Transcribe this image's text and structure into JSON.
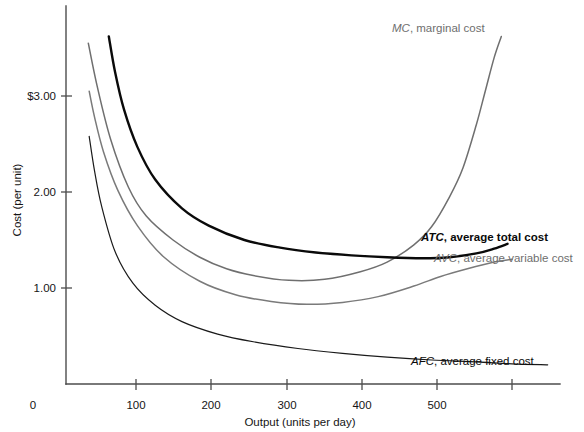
{
  "chart_data": {
    "type": "line",
    "title": "",
    "xlabel": "Output (units per day)",
    "ylabel": "Cost (per unit)",
    "xlim": [
      0,
      560
    ],
    "ylim": [
      0,
      3.5
    ],
    "xticks": [
      0,
      100,
      200,
      300,
      400,
      500
    ],
    "xtick_labels": [
      "0",
      "100",
      "200",
      "300",
      "400",
      "500"
    ],
    "yticks": [
      1.0,
      2.0,
      3.0
    ],
    "ytick_labels": [
      "1.00",
      "2.00",
      "$3.00"
    ],
    "grid": false,
    "legend_position": "inline-annotations",
    "series": [
      {
        "name": "MC",
        "label_abbr": "MC",
        "label_rest": ", marginal cost",
        "color": "#6f6f6f",
        "style": "thin-gray",
        "x": [
          25,
          35,
          50,
          70,
          90,
          120,
          150,
          180,
          210,
          250,
          290,
          330,
          360,
          390,
          410,
          430,
          445,
          460,
          470,
          480,
          488
        ],
        "y": [
          3.55,
          3.1,
          2.55,
          2.05,
          1.75,
          1.5,
          1.32,
          1.2,
          1.13,
          1.08,
          1.09,
          1.17,
          1.27,
          1.45,
          1.64,
          1.95,
          2.25,
          2.7,
          3.05,
          3.4,
          3.62
        ]
      },
      {
        "name": "ATC",
        "label_abbr": "ATC",
        "label_rest": ", average total cost",
        "color": "#0a0a0a",
        "style": "thick-black",
        "x": [
          48,
          55,
          65,
          80,
          100,
          130,
          160,
          200,
          240,
          280,
          320,
          360,
          400,
          430,
          460,
          480,
          495
        ],
        "y": [
          3.62,
          3.25,
          2.86,
          2.47,
          2.13,
          1.83,
          1.65,
          1.5,
          1.42,
          1.37,
          1.34,
          1.32,
          1.31,
          1.32,
          1.36,
          1.41,
          1.46
        ]
      },
      {
        "name": "AVC",
        "label_abbr": "AVC",
        "label_rest": ", average variable cost",
        "color": "#7a7a7a",
        "style": "thin-gray",
        "x": [
          26,
          32,
          42,
          58,
          80,
          110,
          150,
          190,
          230,
          270,
          310,
          350,
          390,
          420,
          450,
          480,
          500
        ],
        "y": [
          3.05,
          2.78,
          2.42,
          2.02,
          1.65,
          1.32,
          1.07,
          0.93,
          0.86,
          0.83,
          0.85,
          0.91,
          1.02,
          1.12,
          1.2,
          1.27,
          1.3
        ]
      },
      {
        "name": "AFC",
        "label_abbr": "AFC",
        "label_rest": ", average fixed cost",
        "color": "#1a1a1a",
        "style": "thin-black",
        "x": [
          26,
          32,
          40,
          55,
          75,
          100,
          130,
          170,
          210,
          260,
          310,
          360,
          410,
          460,
          500,
          540
        ],
        "y": [
          2.58,
          2.22,
          1.85,
          1.38,
          1.05,
          0.82,
          0.65,
          0.52,
          0.44,
          0.37,
          0.32,
          0.28,
          0.25,
          0.23,
          0.21,
          0.2
        ]
      }
    ],
    "annotations": [
      {
        "id": "mc-label",
        "abbr": "MC",
        "rest": ", marginal cost",
        "emphasis": "gray"
      },
      {
        "id": "atc-label",
        "abbr": "ATC",
        "rest": ", average total cost",
        "emphasis": "bold"
      },
      {
        "id": "avc-label",
        "abbr": "AVC",
        "rest": ", average variable cost",
        "emphasis": "gray"
      },
      {
        "id": "afc-label",
        "abbr": "AFC",
        "rest": ", average fixed cost",
        "emphasis": "dark"
      }
    ]
  },
  "axes": {
    "x_title": "Output (units per day)",
    "y_title": "Cost (per unit)",
    "origin_label": "0",
    "x_labels": [
      "100",
      "200",
      "300",
      "400",
      "500"
    ],
    "y_labels": [
      "$3.00",
      "2.00",
      "1.00"
    ]
  },
  "colors": {
    "background": "#ffffff",
    "axis": "#4d4d4d",
    "mc": "#6f6f6f",
    "atc": "#0a0a0a",
    "avc": "#7a7a7a",
    "afc": "#1a1a1a",
    "text": "#151515",
    "gray_text": "#6e6e6e"
  }
}
